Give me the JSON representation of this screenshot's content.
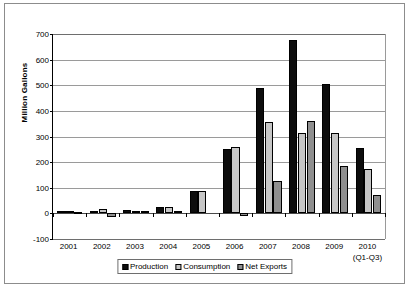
{
  "chart_data": {
    "type": "bar",
    "title": "",
    "subtitle": "",
    "xlabel": "",
    "ylabel": "Million Gallons",
    "ylim": [
      -100,
      700
    ],
    "ytick_step": 100,
    "yticks": [
      700,
      600,
      500,
      400,
      300,
      200,
      100,
      0,
      -100
    ],
    "ytick_labels": [
      "700",
      "600",
      "500",
      "400",
      "300",
      "200",
      "100",
      "0",
      "-100"
    ],
    "grid": true,
    "grid_axis": "y",
    "legend_position": "bottom-center",
    "categories": [
      "2001",
      "2002",
      "2003",
      "2004",
      "2005",
      "2006",
      "2007",
      "2008",
      "2009",
      "2010"
    ],
    "category_sublabels": [
      "",
      "",
      "",
      "",
      "",
      "",
      "",
      "",
      "",
      "(Q1-Q3)"
    ],
    "series": [
      {
        "name": "Production",
        "color": "#0d0d0d",
        "values": [
          10,
          10,
          13,
          26,
          88,
          250,
          488,
          678,
          505,
          255
        ]
      },
      {
        "name": "Consumption",
        "color": "#c6c6c6",
        "values": [
          8,
          17,
          10,
          23,
          88,
          258,
          355,
          312,
          312,
          172
        ]
      },
      {
        "name": "Net Exports",
        "color": "#8f8f8f",
        "values": [
          -2,
          -15,
          1,
          2,
          0,
          -12,
          128,
          360,
          185,
          70
        ]
      }
    ]
  },
  "legend": {
    "items": [
      {
        "label": "Production"
      },
      {
        "label": "Consumption"
      },
      {
        "label": "Net Exports"
      }
    ]
  }
}
